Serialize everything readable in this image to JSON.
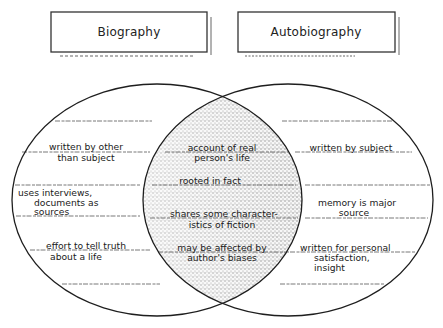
{
  "diagram": {
    "type": "venn",
    "left_set": {
      "title": "Biography",
      "items": [
        {
          "line1": "written by other",
          "line2": "than subject"
        },
        {
          "line1": "uses interviews,",
          "line2": "documents as",
          "line3": "sources"
        },
        {
          "line1": "effort to tell truth",
          "line2": "about a life"
        }
      ]
    },
    "right_set": {
      "title": "Autobiography",
      "items": [
        {
          "line1": "written by subject"
        },
        {
          "line1": "memory is major",
          "line2": "source"
        },
        {
          "line1": "written for personal",
          "line2": "satisfaction,",
          "line3": "insight"
        }
      ]
    },
    "overlap": {
      "items": [
        {
          "line1": "account of real",
          "line2": "person's life"
        },
        {
          "line1": "rooted in fact"
        },
        {
          "line1": "shares some character-",
          "line2": "istics of fiction"
        },
        {
          "line1": "may be affected by",
          "line2": "author's biases"
        }
      ]
    },
    "colors": {
      "outline": "#1e1e1e",
      "overlap_shading": "#8a8a8a",
      "background": "#ffffff"
    }
  }
}
